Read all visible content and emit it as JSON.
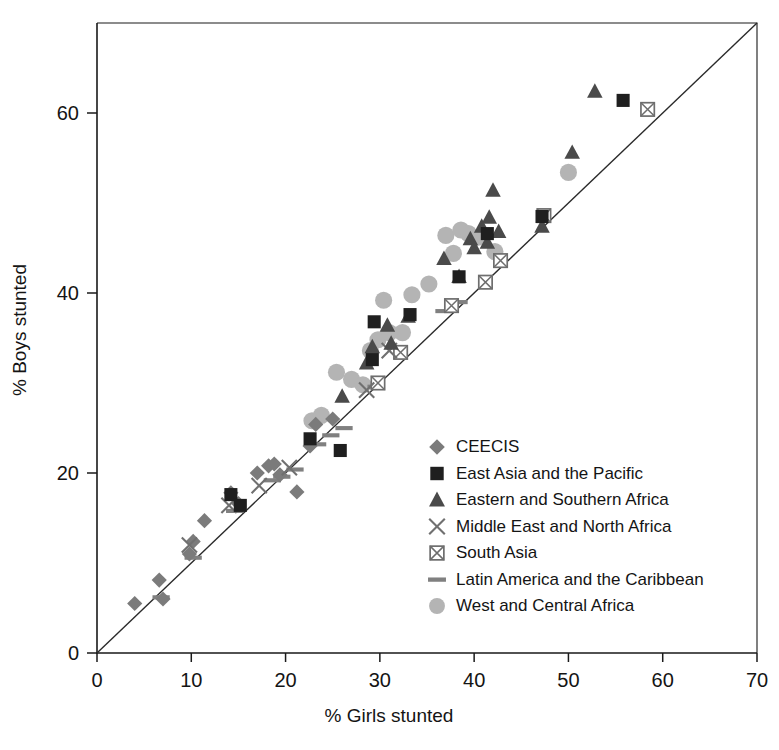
{
  "chart_data": {
    "type": "scatter",
    "title": "",
    "xlabel": "% Girls stunted",
    "ylabel": "% Boys stunted",
    "xlim": [
      0,
      70
    ],
    "ylim": [
      0,
      70
    ],
    "xticks": [
      0,
      10,
      20,
      30,
      40,
      50,
      60,
      70
    ],
    "yticks": [
      0,
      20,
      40,
      60
    ],
    "grid": false,
    "legend_position": "inside-lower-right",
    "reference_line": {
      "name": "equality-line",
      "description": "y = x diagonal",
      "from": [
        0,
        0
      ],
      "to": [
        70,
        70
      ]
    },
    "series": [
      {
        "name": "CEECIS",
        "marker": "diamond",
        "color": "#7b7b7b",
        "points": [
          [
            4.0,
            5.5
          ],
          [
            6.6,
            8.1
          ],
          [
            7.0,
            6.0
          ],
          [
            9.8,
            11.0
          ],
          [
            10.2,
            12.4
          ],
          [
            11.4,
            14.7
          ],
          [
            14.2,
            17.8
          ],
          [
            15.0,
            16.6
          ],
          [
            17.0,
            20.0
          ],
          [
            18.2,
            20.8
          ],
          [
            18.8,
            21.0
          ],
          [
            19.4,
            19.8
          ],
          [
            21.2,
            17.9
          ],
          [
            22.6,
            23.0
          ],
          [
            23.2,
            25.4
          ],
          [
            25.0,
            26.0
          ]
        ]
      },
      {
        "name": "East Asia and the Pacific",
        "marker": "square",
        "color": "#1f1f1f",
        "points": [
          [
            14.2,
            17.6
          ],
          [
            15.2,
            16.4
          ],
          [
            22.6,
            23.8
          ],
          [
            25.8,
            22.5
          ],
          [
            29.2,
            32.6
          ],
          [
            29.4,
            36.8
          ],
          [
            33.2,
            37.6
          ],
          [
            38.4,
            41.8
          ],
          [
            41.4,
            46.6
          ],
          [
            47.2,
            48.5
          ],
          [
            55.8,
            61.4
          ]
        ]
      },
      {
        "name": "Eastern and Southern Africa",
        "marker": "triangle",
        "color": "#4a4a4a",
        "points": [
          [
            26.0,
            28.5
          ],
          [
            28.6,
            32.2
          ],
          [
            29.2,
            34.0
          ],
          [
            30.8,
            36.4
          ],
          [
            31.2,
            34.4
          ],
          [
            33.0,
            37.4
          ],
          [
            36.8,
            43.8
          ],
          [
            38.4,
            41.8
          ],
          [
            39.6,
            46.0
          ],
          [
            40.0,
            45.0
          ],
          [
            40.8,
            47.4
          ],
          [
            41.4,
            45.6
          ],
          [
            41.6,
            48.4
          ],
          [
            42.0,
            51.4
          ],
          [
            42.6,
            46.8
          ],
          [
            47.2,
            47.4
          ],
          [
            50.4,
            55.6
          ],
          [
            52.8,
            62.4
          ]
        ]
      },
      {
        "name": "Middle East and North Africa",
        "marker": "cross",
        "color": "#707070",
        "points": [
          [
            9.8,
            12.0
          ],
          [
            14.0,
            16.4
          ],
          [
            17.2,
            18.6
          ],
          [
            20.4,
            20.6
          ],
          [
            28.6,
            29.2
          ],
          [
            31.0,
            33.6
          ]
        ]
      },
      {
        "name": "South Asia",
        "marker": "crossed-square",
        "color": "#6e6e6e",
        "points": [
          [
            29.8,
            30.0
          ],
          [
            32.2,
            33.4
          ],
          [
            37.6,
            38.6
          ],
          [
            41.2,
            41.2
          ],
          [
            42.8,
            43.6
          ],
          [
            47.4,
            48.6
          ],
          [
            58.4,
            60.4
          ]
        ]
      },
      {
        "name": "Latin America and the Caribbean",
        "marker": "dash",
        "color": "#808080",
        "points": [
          [
            6.8,
            6.2
          ],
          [
            10.2,
            10.6
          ],
          [
            14.6,
            15.8
          ],
          [
            18.6,
            19.2
          ],
          [
            19.6,
            19.6
          ],
          [
            21.0,
            20.4
          ],
          [
            23.4,
            23.2
          ],
          [
            24.8,
            24.2
          ],
          [
            26.2,
            25.0
          ],
          [
            29.6,
            29.6
          ],
          [
            36.8,
            38.0
          ],
          [
            38.4,
            39.0
          ]
        ]
      },
      {
        "name": "West and Central Africa",
        "marker": "circle",
        "color": "#b4b4b4",
        "points": [
          [
            22.8,
            25.8
          ],
          [
            23.8,
            26.4
          ],
          [
            25.4,
            31.2
          ],
          [
            27.0,
            30.4
          ],
          [
            28.2,
            29.8
          ],
          [
            29.0,
            33.6
          ],
          [
            29.8,
            34.8
          ],
          [
            30.4,
            39.2
          ],
          [
            31.0,
            35.6
          ],
          [
            32.4,
            35.6
          ],
          [
            33.4,
            39.8
          ],
          [
            35.2,
            41.0
          ],
          [
            37.0,
            46.4
          ],
          [
            37.8,
            44.4
          ],
          [
            38.6,
            47.0
          ],
          [
            39.4,
            46.6
          ],
          [
            40.4,
            46.2
          ],
          [
            42.2,
            44.6
          ],
          [
            50.0,
            53.4
          ]
        ]
      }
    ]
  },
  "axes": {
    "x_title": "% Girls stunted",
    "y_title": "% Boys stunted",
    "x_tick_labels": [
      "0",
      "10",
      "20",
      "30",
      "40",
      "50",
      "60",
      "70"
    ],
    "y_tick_labels": [
      "0",
      "20",
      "40",
      "60"
    ]
  },
  "legend": {
    "items": [
      {
        "label": "CEECIS",
        "marker": "diamond-icon",
        "color": "#7b7b7b"
      },
      {
        "label": "East Asia and the Pacific",
        "marker": "square-icon",
        "color": "#1f1f1f"
      },
      {
        "label": "Eastern and Southern Africa",
        "marker": "triangle-icon",
        "color": "#4a4a4a"
      },
      {
        "label": "Middle East and North Africa",
        "marker": "cross-icon",
        "color": "#707070"
      },
      {
        "label": "South Asia",
        "marker": "crossed-square-icon",
        "color": "#6e6e6e"
      },
      {
        "label": "Latin America and the Caribbean",
        "marker": "dash-icon",
        "color": "#808080"
      },
      {
        "label": "West and Central Africa",
        "marker": "circle-icon",
        "color": "#b4b4b4"
      }
    ]
  },
  "colors": {
    "axis": "#1a1a1a",
    "background": "#ffffff",
    "reference_line": "#2a2a2a"
  }
}
